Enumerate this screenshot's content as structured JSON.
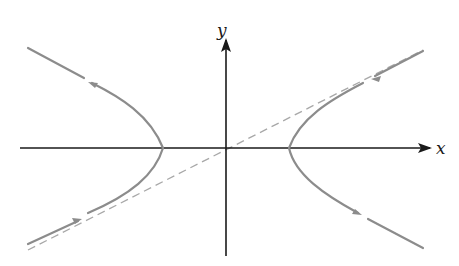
{
  "diagram": {
    "type": "phase-portrait",
    "axes": {
      "x_label": "x",
      "y_label": "y",
      "origin": [
        226,
        148
      ],
      "x_range_px": [
        20,
        432
      ],
      "y_range_px": [
        40,
        256
      ],
      "color": "#1a1a1a"
    },
    "asymptote": {
      "style": "dashed",
      "from": [
        28,
        250
      ],
      "to": [
        423,
        50
      ],
      "color": "#a0a0a0"
    },
    "trajectories": [
      {
        "name": "left-branch",
        "vertex": [
          163,
          148
        ],
        "upper_end": [
          28,
          48
        ],
        "lower_end": [
          28,
          245
        ],
        "upper_arrow_direction": "away-from-vertex",
        "lower_arrow_direction": "toward-vertex"
      },
      {
        "name": "right-branch",
        "vertex": [
          289,
          148
        ],
        "upper_end": [
          423,
          50
        ],
        "lower_end": [
          423,
          248
        ],
        "upper_arrow_direction": "toward-vertex",
        "lower_arrow_direction": "away-from-vertex"
      }
    ],
    "curve_color": "#8c8c8c"
  }
}
